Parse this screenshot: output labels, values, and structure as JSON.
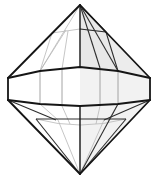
{
  "figure": {
    "canvas": {
      "width": 158,
      "height": 179,
      "background": "#ffffff"
    },
    "palette": {
      "outline_dark": "#151515",
      "edge_medium": "#2e2e2e",
      "edge_light": "#9a9a9a",
      "edge_faint": "#b8b8b8",
      "shade_fill": "#ececec",
      "shade_fill_soft": "#f2f2f2",
      "background": "#ffffff"
    },
    "geometry": {
      "apex_top": [
        80,
        5
      ],
      "apex_bottom": [
        80,
        174
      ],
      "girdle_left_top": [
        8,
        78
      ],
      "girdle_left_bottom": [
        8,
        100
      ],
      "girdle_right_top": [
        150,
        78
      ],
      "girdle_right_bottom": [
        150,
        100
      ],
      "girdle_top_y": 78,
      "girdle_bottom_y": 100,
      "upper_table_y": 30,
      "lower_band_y": 118,
      "girdle_top_points": [
        [
          8,
          78
        ],
        [
          40,
          71
        ],
        [
          80,
          67
        ],
        [
          118,
          71
        ],
        [
          150,
          78
        ]
      ],
      "girdle_bottom_points": [
        [
          8,
          100
        ],
        [
          40,
          104
        ],
        [
          80,
          106
        ],
        [
          118,
          104
        ],
        [
          150,
          100
        ]
      ],
      "upper_table_points": [
        [
          50,
          32
        ],
        [
          80,
          28
        ],
        [
          106,
          32
        ]
      ],
      "lower_band_points": [
        [
          36,
          119
        ],
        [
          80,
          126
        ],
        [
          126,
          119
        ]
      ],
      "crown_divider_x": [
        40,
        62,
        80,
        100,
        120
      ],
      "pavilion_divider_x": [
        36,
        58,
        80,
        104,
        126
      ]
    },
    "shaded_regions": [
      {
        "name": "crown-right-facet",
        "fill": "#ececec"
      },
      {
        "name": "girdle-right-facets",
        "fill": "#f2f2f2"
      },
      {
        "name": "pavilion-right-facet",
        "fill": "#f2f2f2"
      }
    ]
  },
  "labels": {
    "caption": "",
    "alt": "Line drawing of an octahedral faceted gem with girdle band"
  }
}
